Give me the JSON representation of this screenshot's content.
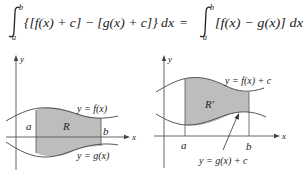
{
  "equation": {
    "left_integral": {
      "upper_limit": "b",
      "lower_limit": "a",
      "integrand": "{[f(x) + c] − [g(x) + c]} dx"
    },
    "equals": "=",
    "right_integral": {
      "upper_limit": "b",
      "lower_limit": "a",
      "integrand": "[f(x) − g(x)] dx"
    }
  },
  "left_graph": {
    "y_axis_label": "y",
    "x_axis_label": "x",
    "top_curve_label": "y = f(x)",
    "bottom_curve_label": "y = g(x)",
    "region_label": "R",
    "a_label": "a",
    "b_label": "b"
  },
  "right_graph": {
    "y_axis_label": "y",
    "x_axis_label": "x",
    "top_curve_label": "y = f(x) + c",
    "bottom_curve_label": "y = g(x) + c",
    "region_label": "R′",
    "a_label": "a",
    "b_label": "b"
  },
  "colors": {
    "shade": "#bdbdbd",
    "curve": "#444444",
    "axis": "#555555",
    "text": "#222222"
  }
}
